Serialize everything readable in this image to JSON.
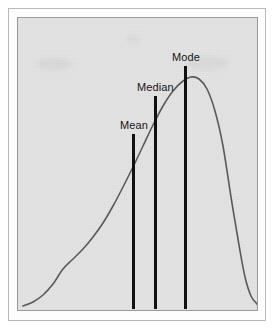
{
  "figure": {
    "background_color": "#ffffff",
    "panel_color": "#e3e3e3",
    "frame_color": "#9a9a9a",
    "curve_color": "#5a5a5a",
    "marker_color": "#101010"
  },
  "markers": [
    {
      "label": "Mean",
      "x": 131,
      "top": 133,
      "bottom": 308
    },
    {
      "label": "Median",
      "x": 153,
      "top": 95,
      "bottom": 308
    },
    {
      "label": "Mode",
      "x": 183,
      "top": 65,
      "bottom": 308
    }
  ],
  "chart_data": {
    "type": "line",
    "title": "",
    "xlabel": "",
    "ylabel": "",
    "grid": false,
    "legend": false,
    "annotations": [
      "Mean",
      "Median",
      "Mode"
    ],
    "curve_points": [
      [
        22,
        305
      ],
      [
        32,
        301
      ],
      [
        42,
        294
      ],
      [
        52,
        283
      ],
      [
        62,
        268
      ],
      [
        72,
        258
      ],
      [
        82,
        248
      ],
      [
        92,
        236
      ],
      [
        102,
        222
      ],
      [
        112,
        205
      ],
      [
        122,
        186
      ],
      [
        132,
        166
      ],
      [
        142,
        145
      ],
      [
        152,
        124
      ],
      [
        162,
        105
      ],
      [
        172,
        90
      ],
      [
        182,
        80
      ],
      [
        190,
        76
      ],
      [
        198,
        78
      ],
      [
        206,
        88
      ],
      [
        214,
        110
      ],
      [
        222,
        145
      ],
      [
        230,
        196
      ],
      [
        238,
        244
      ],
      [
        244,
        276
      ],
      [
        250,
        295
      ],
      [
        256,
        303
      ],
      [
        258,
        306
      ]
    ]
  }
}
